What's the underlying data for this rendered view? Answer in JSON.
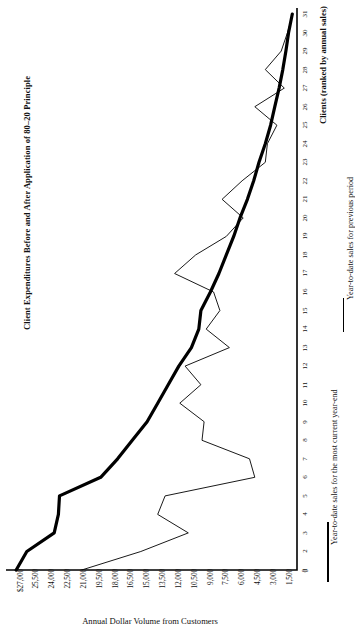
{
  "title": "Client Expenditures Before and After Application of 80–20 Principle",
  "axes": {
    "value_axis_caption": "Annual Dollar Volume from Customers",
    "category_axis_caption": "Clients (ranked by annual sales)"
  },
  "legend": {
    "current_label": "Year-to-date sales for the most current year-end",
    "previous_label": "Year-to-date sales for previous period"
  },
  "chart_data": {
    "type": "line",
    "orientation": "horizontal",
    "title": "Client Expenditures Before and After Application of 80–20 Principle",
    "xlabel": "Clients (ranked by annual sales)",
    "ylabel": "Annual Dollar Volume from Customers",
    "grid": false,
    "legend_position": "right",
    "categories": [
      1,
      2,
      3,
      4,
      5,
      6,
      7,
      8,
      9,
      10,
      11,
      12,
      13,
      14,
      15,
      16,
      17,
      18,
      19,
      20,
      21,
      22,
      23,
      24,
      25,
      26,
      27,
      28,
      29,
      30,
      31
    ],
    "value_ticks": [
      "$27,000",
      "25,500",
      "24,000",
      "22,500",
      "21,000",
      "19,500",
      "18,000",
      "16,500",
      "15,000",
      "13,500",
      "12,000",
      "10,500",
      "9,000",
      "7,500",
      "6,000",
      "4,500",
      "3,000",
      "1,500",
      "0"
    ],
    "value_tick_numbers": [
      27000,
      25500,
      24000,
      22500,
      21000,
      19500,
      18000,
      16500,
      15000,
      13500,
      12000,
      10500,
      9000,
      7500,
      6000,
      4500,
      3000,
      1500,
      0
    ],
    "ylim": [
      0,
      27000
    ],
    "series": [
      {
        "name": "Year-to-date sales for the most current year-end",
        "style": "thick-black",
        "color": "#000000",
        "width": 3.2,
        "values": [
          26600,
          25600,
          23000,
          22600,
          22500,
          18600,
          17000,
          15600,
          14200,
          13200,
          12200,
          11200,
          10000,
          9300,
          9100,
          8200,
          7400,
          6700,
          6000,
          5400,
          4700,
          4100,
          3600,
          3000,
          2500,
          2100,
          1700,
          1350,
          1050,
          800,
          450
        ]
      },
      {
        "name": "Year-to-date sales for previous period",
        "style": "thin-black",
        "color": "#000000",
        "width": 0.9,
        "values": [
          20400,
          14800,
          10300,
          13200,
          12500,
          4000,
          4500,
          9000,
          8800,
          11100,
          9100,
          10600,
          6400,
          8600,
          7300,
          7900,
          11600,
          9600,
          6700,
          5100,
          7100,
          5200,
          3000,
          2800,
          1900,
          4000,
          1200,
          3000,
          1500,
          900,
          400
        ]
      }
    ]
  }
}
